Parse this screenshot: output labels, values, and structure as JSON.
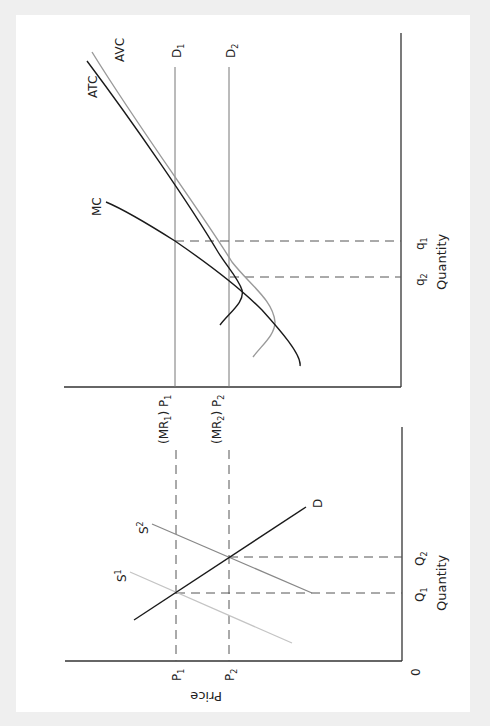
{
  "figure": {
    "orientation": "rotated 90 degrees clockwise",
    "market_panel": {
      "x_axis_label": "Quantity",
      "y_axis_label": "Price",
      "origin_label": "0",
      "price_ticks": [
        {
          "main": "P",
          "sub": "1"
        },
        {
          "main": "P",
          "sub": "2"
        }
      ],
      "quantity_ticks": [
        {
          "main": "Q",
          "sub": "1"
        },
        {
          "main": "Q",
          "sub": "2"
        }
      ],
      "curves": [
        {
          "name": "D",
          "label": "D",
          "sup": ""
        },
        {
          "name": "S1",
          "label": "S",
          "sup": "1"
        },
        {
          "name": "S2",
          "label": "S",
          "sup": "2"
        }
      ]
    },
    "firm_panel": {
      "x_axis_label": "Quantity",
      "price_ticks": [
        {
          "pre": "(MR",
          "pre_sub": "1",
          "mid": ") P",
          "sub": "1"
        },
        {
          "pre": "(MR",
          "pre_sub": "2",
          "mid": ") P",
          "sub": "2"
        }
      ],
      "quantity_ticks": [
        {
          "main": "q",
          "sub": "1"
        },
        {
          "main": "q",
          "sub": "2"
        }
      ],
      "curves": [
        {
          "name": "MC",
          "label": "MC"
        },
        {
          "name": "ATC",
          "label": "ATC"
        },
        {
          "name": "AVC",
          "label": "AVC"
        },
        {
          "name": "D1",
          "label": "D",
          "sub": "1"
        },
        {
          "name": "D2",
          "label": "D",
          "sub": "2"
        }
      ]
    },
    "colors": {
      "background_frame": "#efefef",
      "page": "#ffffff",
      "dark_curve": "#1a1a1a",
      "avc_curve": "#9a9a9a",
      "s2_curve": "#888888",
      "s1_curve": "#c4c4c4"
    }
  }
}
